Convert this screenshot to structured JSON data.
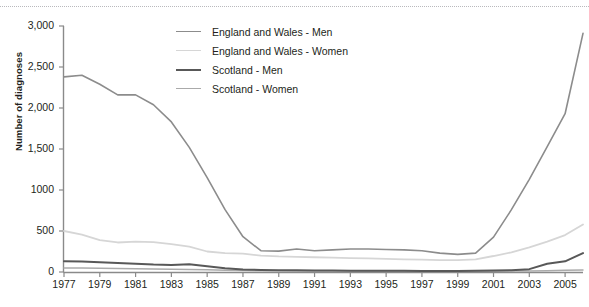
{
  "chart": {
    "ylabel": "Number of diagnoses",
    "ytick_labels": [
      "3,000",
      "2,500",
      "2,000",
      "1,500",
      "1000",
      "500",
      "0"
    ],
    "xtick_labels": [
      "1977",
      "1979",
      "1981",
      "1983",
      "1985",
      "1987",
      "1989",
      "1991",
      "1993",
      "1995",
      "1997",
      "1999",
      "2001",
      "2003",
      "2005"
    ],
    "legend": [
      {
        "label": "England and Wales - Men",
        "color": "#8c8c8c",
        "width": 1.6
      },
      {
        "label": "England and Wales - Women",
        "color": "#d6d6d6",
        "width": 1.8
      },
      {
        "label": "Scotland - Men",
        "color": "#585858",
        "width": 2.0
      },
      {
        "label": "Scotland - Women",
        "color": "#aaaaaa",
        "width": 1.5
      }
    ]
  },
  "chart_data": {
    "type": "line",
    "title": "",
    "xlabel": "",
    "ylabel": "Number of diagnoses",
    "xlim": [
      1977,
      2006
    ],
    "ylim": [
      0,
      3000
    ],
    "ytick_values": [
      0,
      500,
      1000,
      1500,
      2000,
      2500,
      3000
    ],
    "xtick_values": [
      1977,
      1979,
      1981,
      1983,
      1985,
      1987,
      1989,
      1991,
      1993,
      1995,
      1997,
      1999,
      2001,
      2003,
      2005
    ],
    "grid": false,
    "legend_position": "upper-center",
    "x": [
      1977,
      1978,
      1979,
      1980,
      1981,
      1982,
      1983,
      1984,
      1985,
      1986,
      1987,
      1988,
      1989,
      1990,
      1991,
      1992,
      1993,
      1994,
      1995,
      1996,
      1997,
      1998,
      1999,
      2000,
      2001,
      2002,
      2003,
      2004,
      2005,
      2006
    ],
    "series": [
      {
        "name": "England and Wales - Men",
        "color": "#8c8c8c",
        "values": [
          2380,
          2400,
          2290,
          2160,
          2160,
          2040,
          1830,
          1520,
          1150,
          760,
          430,
          260,
          255,
          280,
          260,
          270,
          280,
          280,
          275,
          270,
          260,
          230,
          215,
          230,
          425,
          760,
          1130,
          1530,
          1930,
          2910
        ]
      },
      {
        "name": "England and Wales - Women",
        "color": "#d6d6d6",
        "values": [
          500,
          455,
          390,
          360,
          370,
          365,
          340,
          310,
          250,
          230,
          225,
          200,
          190,
          185,
          180,
          175,
          170,
          165,
          160,
          155,
          150,
          145,
          145,
          155,
          195,
          240,
          300,
          370,
          450,
          580
        ]
      },
      {
        "name": "Scotland - Men",
        "color": "#585858",
        "values": [
          130,
          128,
          120,
          110,
          100,
          90,
          85,
          95,
          70,
          45,
          30,
          25,
          22,
          20,
          18,
          17,
          16,
          15,
          14,
          14,
          13,
          12,
          12,
          14,
          18,
          22,
          35,
          100,
          130,
          230
        ]
      },
      {
        "name": "Scotland - Women",
        "color": "#aaaaaa",
        "values": [
          50,
          48,
          45,
          42,
          40,
          38,
          35,
          32,
          28,
          22,
          18,
          15,
          14,
          13,
          12,
          11,
          11,
          10,
          10,
          9,
          9,
          9,
          8,
          9,
          10,
          11,
          13,
          16,
          20,
          25
        ]
      }
    ]
  }
}
